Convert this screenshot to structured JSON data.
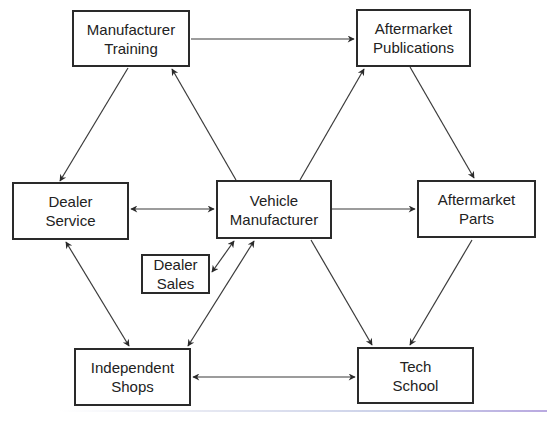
{
  "diagram": {
    "nodes": [
      {
        "id": "manufacturer-training",
        "line1": "Manufacturer",
        "line2": "Training",
        "x": 72,
        "y": 10,
        "w": 118,
        "h": 57
      },
      {
        "id": "aftermarket-publications",
        "line1": "Aftermarket",
        "line2": "Publications",
        "x": 356,
        "y": 9,
        "w": 115,
        "h": 58
      },
      {
        "id": "dealer-service",
        "line1": "Dealer",
        "line2": "Service",
        "x": 12,
        "y": 182,
        "w": 117,
        "h": 58
      },
      {
        "id": "vehicle-manufacturer",
        "line1": "Vehicle",
        "line2": "Manufacturer",
        "x": 216,
        "y": 180,
        "w": 116,
        "h": 59
      },
      {
        "id": "aftermarket-parts",
        "line1": "Aftermarket",
        "line2": "Parts",
        "x": 417,
        "y": 180,
        "w": 119,
        "h": 58
      },
      {
        "id": "dealer-sales",
        "line1": "Dealer",
        "line2": "Sales",
        "x": 141,
        "y": 254,
        "w": 69,
        "h": 40
      },
      {
        "id": "independent-shops",
        "line1": "Independent",
        "line2": "Shops",
        "x": 74,
        "y": 348,
        "w": 117,
        "h": 58
      },
      {
        "id": "tech-school",
        "line1": "Tech",
        "line2": "School",
        "x": 357,
        "y": 347,
        "w": 117,
        "h": 57
      }
    ],
    "edges": [
      {
        "from": "manufacturer-training",
        "to": "aftermarket-publications",
        "direction": "forward"
      },
      {
        "from": "vehicle-manufacturer",
        "to": "manufacturer-training",
        "direction": "forward"
      },
      {
        "from": "manufacturer-training",
        "to": "dealer-service",
        "direction": "forward"
      },
      {
        "from": "vehicle-manufacturer",
        "to": "aftermarket-publications",
        "direction": "forward"
      },
      {
        "from": "aftermarket-publications",
        "to": "aftermarket-parts",
        "direction": "forward"
      },
      {
        "from": "dealer-service",
        "to": "vehicle-manufacturer",
        "direction": "both"
      },
      {
        "from": "vehicle-manufacturer",
        "to": "aftermarket-parts",
        "direction": "forward"
      },
      {
        "from": "dealer-sales",
        "to": "vehicle-manufacturer",
        "direction": "both"
      },
      {
        "from": "independent-shops",
        "to": "vehicle-manufacturer",
        "direction": "both"
      },
      {
        "from": "dealer-service",
        "to": "independent-shops",
        "direction": "both"
      },
      {
        "from": "vehicle-manufacturer",
        "to": "tech-school",
        "direction": "forward"
      },
      {
        "from": "aftermarket-parts",
        "to": "tech-school",
        "direction": "forward"
      },
      {
        "from": "independent-shops",
        "to": "tech-school",
        "direction": "both"
      }
    ],
    "colors": {
      "line": "#3a3a3a",
      "box_border": "#2a2a2a",
      "text": "#222222",
      "background": "#ffffff"
    }
  }
}
